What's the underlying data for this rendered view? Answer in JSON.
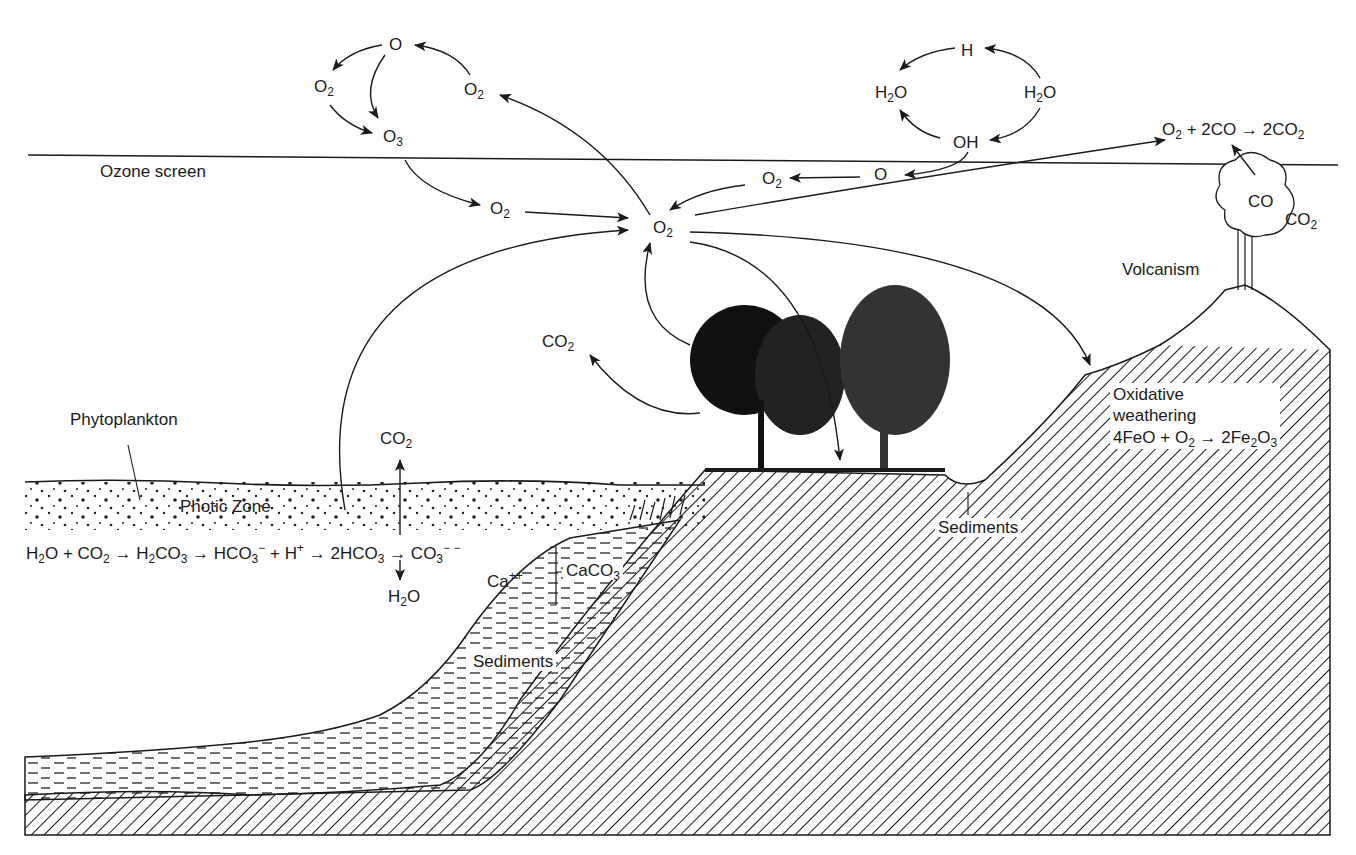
{
  "diagram": {
    "type": "oxygen cycle cross-section",
    "colors": {
      "ink": "#1a1a1a",
      "background": "#ffffff"
    },
    "boundary": {
      "label": "Ozone screen"
    },
    "upper_atmosphere": {
      "ozone_cycle": {
        "O": "O",
        "O2_left": "O",
        "O3": "O",
        "O2_right": "O"
      },
      "water_cycle": {
        "H": "H",
        "H2O_left_pre": "H",
        "H2O_left_post": "O",
        "H2O_right_pre": "H",
        "H2O_right_post": "O",
        "OH": "OH"
      }
    },
    "atmosphere": {
      "O_free": "O",
      "O2_mid": "O",
      "O2_left": "O",
      "O2_center": "O",
      "CO2_trees": "CO",
      "CO2_ocean": "CO"
    },
    "volcanic_reaction": {
      "o2": "O",
      "plus": "+ 2CO",
      "arrow": "→",
      "product": "2CO"
    },
    "volcano": {
      "label": "Volcanism",
      "co": "CO",
      "co2": "CO"
    },
    "ocean": {
      "phytoplankton_label": "Phytoplankton",
      "photic_zone_label": "Photic Zone",
      "equation": {
        "p1": "H",
        "p2": "O + CO",
        "p3": "→ H",
        "p4": "CO",
        "p5": "→ HCO",
        "p6": "+ H",
        "p7": "→ 2HCO",
        "p8": "→ CO"
      },
      "h2o_branch": {
        "pre": "H",
        "post": "O"
      },
      "ca_label": "Ca",
      "caco3_label": "CaCO",
      "sediments_label": "Sediments"
    },
    "land": {
      "weathering": {
        "line1": "Oxidative",
        "line2": "weathering",
        "eq_a": "4FeO + O",
        "eq_b": "→ 2Fe",
        "eq_c": "O"
      },
      "sediments_label": "Sediments"
    },
    "subscripts": {
      "two": "2",
      "three": "3"
    },
    "superscripts": {
      "minus": "−",
      "plus": "+",
      "double_minus": "− −",
      "double_plus": "++"
    }
  }
}
